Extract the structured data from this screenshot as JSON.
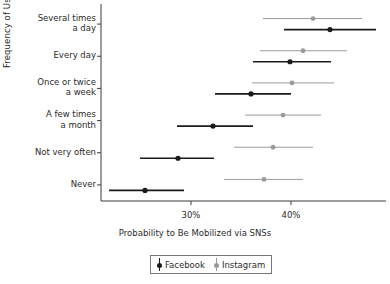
{
  "chart_data": {
    "type": "scatter",
    "title": "",
    "xlabel": "Probability to Be Mobilized via SNSs",
    "ylabel": "Frequency of Use",
    "xlim": [
      21.0,
      49.5
    ],
    "xticks": [
      30,
      40
    ],
    "xticklabels": [
      "30%",
      "40%"
    ],
    "grid": false,
    "legend_position": "bottom-center",
    "categories": [
      "Several times a day",
      "Every day",
      "Once or twice a week",
      "A few times a month",
      "Not very often",
      "Never"
    ],
    "category_labels_wrapped": [
      [
        "Several times",
        "a day"
      ],
      [
        "Every day"
      ],
      [
        "Once or twice",
        "a week"
      ],
      [
        "A few times",
        "a month"
      ],
      [
        "Not very often"
      ],
      [
        "Never"
      ]
    ],
    "series": [
      {
        "name": "Facebook",
        "color": "#1a1a1a",
        "values": [
          43.9,
          39.9,
          36.0,
          32.2,
          28.7,
          25.4
        ],
        "ci_low": [
          39.3,
          36.2,
          32.4,
          28.6,
          24.9,
          21.8
        ],
        "ci_high": [
          48.5,
          44.0,
          40.0,
          36.2,
          32.3,
          29.3
        ]
      },
      {
        "name": "Instagram",
        "color": "#9a9a9a",
        "values": [
          42.2,
          41.2,
          40.1,
          39.2,
          38.2,
          37.3
        ],
        "ci_low": [
          37.2,
          36.9,
          36.1,
          35.4,
          34.3,
          33.3
        ],
        "ci_high": [
          47.1,
          45.6,
          44.3,
          43.0,
          42.2,
          41.2
        ]
      }
    ]
  },
  "legend": {
    "entries": [
      {
        "label": "Facebook"
      },
      {
        "label": "Instagram"
      }
    ]
  },
  "axes": {
    "xlabel": "Probability to Be Mobilized via SNSs",
    "ylabel": "Frequency of Use"
  }
}
